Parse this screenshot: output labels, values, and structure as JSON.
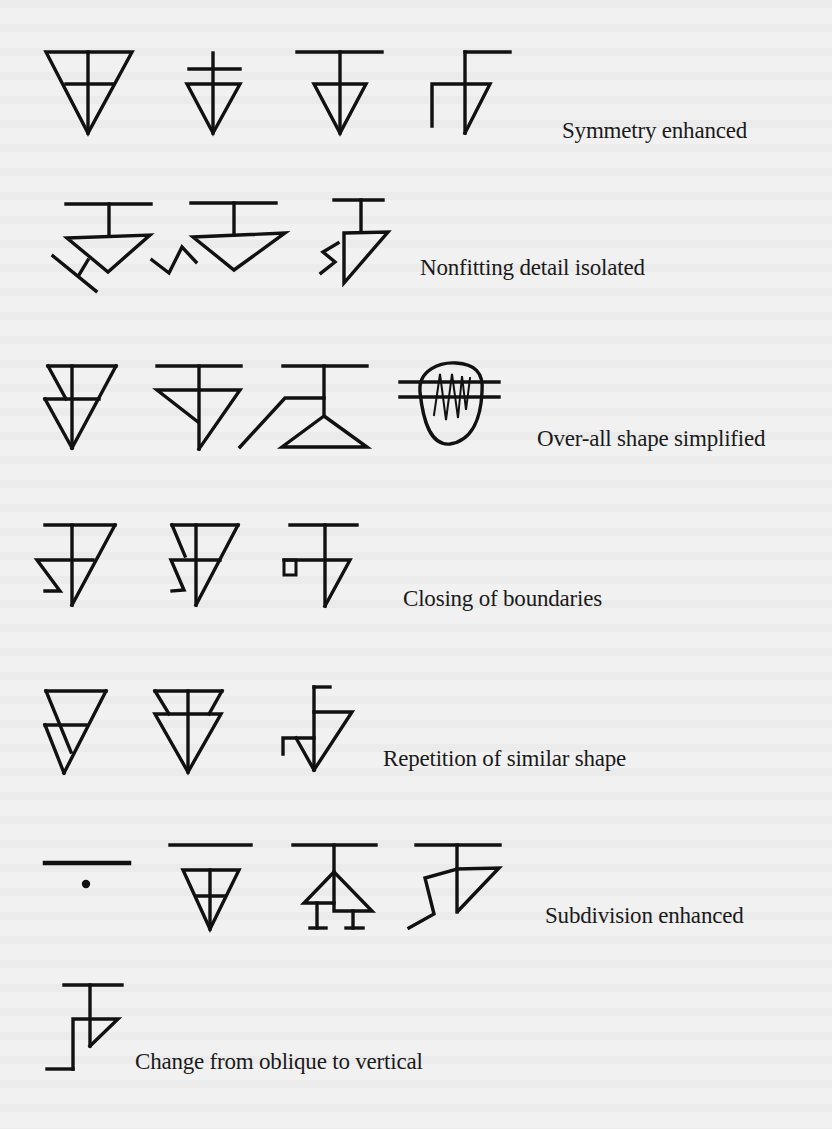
{
  "figure": {
    "rows": [
      {
        "id": "symmetry",
        "label": "Symmetry enhanced",
        "figure_count": 4
      },
      {
        "id": "nonfitting",
        "label": "Nonfitting detail isolated",
        "figure_count": 3
      },
      {
        "id": "overall",
        "label": "Over-all shape simplified",
        "figure_count": 4
      },
      {
        "id": "closing",
        "label": "Closing of boundaries",
        "figure_count": 3
      },
      {
        "id": "repetition",
        "label": "Repetition of similar shape",
        "figure_count": 3
      },
      {
        "id": "subdivision",
        "label": "Subdivision enhanced",
        "figure_count": 4
      },
      {
        "id": "oblique",
        "label": "Change from oblique to vertical",
        "figure_count": 1
      }
    ],
    "colors": {
      "ink": "#111111",
      "background": "#f1f1f1",
      "text": "#1a1a1a"
    }
  }
}
